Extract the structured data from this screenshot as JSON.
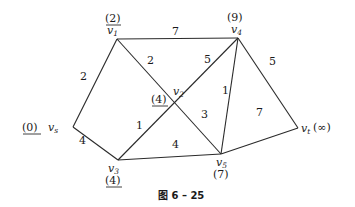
{
  "caption": "图 6 – 25",
  "nodes": {
    "vs": {
      "name": "v",
      "sub": "s",
      "value": "(0)",
      "permanent": true
    },
    "v1": {
      "name": "v",
      "sub": "1",
      "value": "(2)",
      "permanent": true
    },
    "v2": {
      "name": "v",
      "sub": "2",
      "value": "(4)",
      "permanent": true
    },
    "v3": {
      "name": "v",
      "sub": "3",
      "value": "(4)",
      "permanent": true
    },
    "v4": {
      "name": "v",
      "sub": "4",
      "value": "(9)",
      "permanent": false
    },
    "v5": {
      "name": "v",
      "sub": "5",
      "value": "(7)",
      "permanent": false
    },
    "vt": {
      "name": "v",
      "sub": "t",
      "value": "(∞)",
      "permanent": false
    }
  },
  "edges": {
    "vs_v1": "2",
    "vs_v3": "4",
    "v1_v4": "7",
    "v1_v5": "2",
    "v3_v4": "5",
    "v3_v2": "1",
    "v2_v5": "3",
    "v3_v5": "4",
    "v5_v4": "1",
    "v4_vt": "5",
    "v5_vt": "7"
  }
}
